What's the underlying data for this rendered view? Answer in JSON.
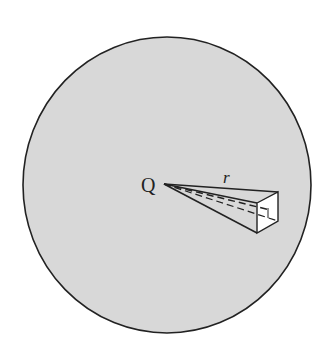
{
  "diagram": {
    "labels": {
      "charge": "Q",
      "radius": "r"
    },
    "colors": {
      "sphere_fill": "#d8d8d8",
      "outline": "#222222",
      "face_fill": "#ffffff"
    }
  }
}
